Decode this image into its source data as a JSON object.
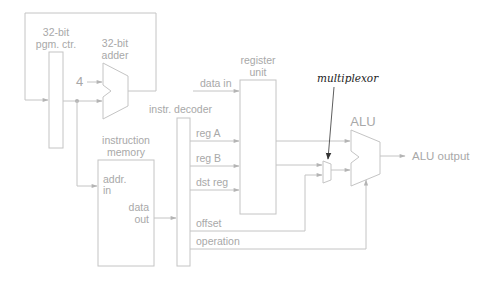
{
  "diagram": {
    "colors": {
      "line": "#c4c4c4",
      "text": "#a8a8a8",
      "annotation": "#222222"
    },
    "program_counter": {
      "label_line1": "32-bit",
      "label_line2": "pgm. ctr."
    },
    "adder": {
      "label_line1": "32-bit",
      "label_line2": "adder",
      "constant_input": "4"
    },
    "instruction_memory": {
      "label_line1": "instruction",
      "label_line2": "memory",
      "input_line1": "addr.",
      "input_line2": "in",
      "output_line1": "data",
      "output_line2": "out"
    },
    "instruction_decoder": {
      "label": "instr. decoder",
      "outputs": [
        "reg A",
        "reg B",
        "dst reg",
        "offset",
        "operation"
      ]
    },
    "register_unit": {
      "label_line1": "register",
      "label_line2": "unit",
      "data_input": "data in"
    },
    "multiplexor": {
      "annotation": "multiplexor"
    },
    "alu": {
      "label": "ALU",
      "output": "ALU output"
    }
  }
}
